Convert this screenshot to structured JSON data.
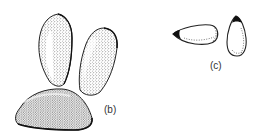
{
  "figure": {
    "panels": [
      {
        "id": "b",
        "label": "(b)",
        "items": [
          {
            "name": "seed-upright-left",
            "shading": "stippled"
          },
          {
            "name": "seed-upright-right",
            "shading": "stippled"
          },
          {
            "name": "seed-lying",
            "shading": "stippled"
          }
        ]
      },
      {
        "id": "c",
        "label": "(c)",
        "items": [
          {
            "name": "seed-horizontal",
            "shading": "outline-dotted",
            "tip": "dark"
          },
          {
            "name": "seed-vertical",
            "shading": "outline-dotted",
            "tip": "dark"
          }
        ]
      }
    ],
    "colors": {
      "ink": "#222222",
      "background": "#ffffff"
    }
  }
}
